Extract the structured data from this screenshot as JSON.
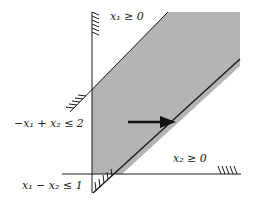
{
  "diagram": {
    "type": "feasible-region",
    "colors": {
      "region_fill": "#b4b4b4",
      "line": "#1a1a1a",
      "background": "#ffffff"
    },
    "constraints": [
      {
        "id": "c1",
        "label": "x₁ ≥ 0"
      },
      {
        "id": "c2",
        "label": "−x₁ + x₂ ≤ 2"
      },
      {
        "id": "c3",
        "label": "x₂ ≥ 0"
      },
      {
        "id": "c4",
        "label": "x₁ − x₂ ≤ 1"
      }
    ],
    "arrow": {
      "direction": "right",
      "meaning": "objective direction"
    }
  }
}
